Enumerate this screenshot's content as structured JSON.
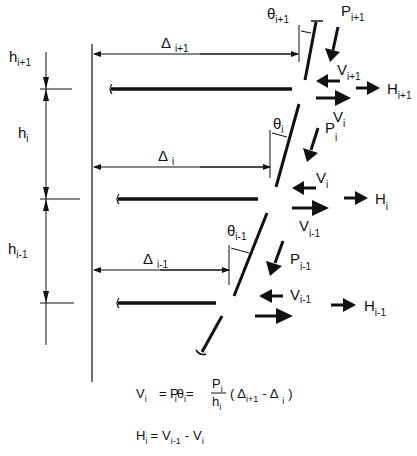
{
  "diagram": {
    "story_heights": [
      {
        "base": "h",
        "sub": "i+1"
      },
      {
        "base": "h",
        "sub": "i"
      },
      {
        "base": "h",
        "sub": "i-1"
      }
    ],
    "displacements": [
      {
        "base": "Δ",
        "sub": "i+1"
      },
      {
        "base": "Δ",
        "sub": "i"
      },
      {
        "base": "Δ",
        "sub": "i-1"
      }
    ],
    "rotations": [
      {
        "base": "θ",
        "sub": "i+1"
      },
      {
        "base": "θ",
        "sub": "i"
      },
      {
        "base": "θ",
        "sub": "i-1"
      }
    ],
    "gravity_loads": [
      {
        "base": "P",
        "sub": "i+1"
      },
      {
        "base": "P",
        "sub": "i"
      },
      {
        "base": "P",
        "sub": "i-1"
      }
    ],
    "shears_left": [
      {
        "base": "V",
        "sub": "i+1"
      },
      {
        "base": "V",
        "sub": "i"
      },
      {
        "base": "V",
        "sub": "i-1"
      }
    ],
    "shears_right": [
      {
        "base": "V",
        "sub": "i"
      },
      {
        "base": "V",
        "sub": "i-1"
      }
    ],
    "lateral_forces": [
      {
        "base": "H",
        "sub": "i+1"
      },
      {
        "base": "H",
        "sub": "i"
      },
      {
        "base": "H",
        "sub": "i-1"
      }
    ],
    "equations": {
      "eq1": {
        "lhs": "V",
        "lhs_sub": "i",
        "eq": "=",
        "p": "P",
        "p_sub": "i",
        "theta": "θ",
        "theta_sub": "i",
        "eq2": "=",
        "num": "P",
        "num_sub": "i",
        "den": "h",
        "den_sub": "i",
        "open": "(",
        "d1": "Δ",
        "d1_sub": "i+1",
        "minus": "-",
        "d2": "Δ",
        "d2_sub": "i",
        "close": ")"
      },
      "eq2": {
        "lhs": "H",
        "lhs_sub": "i",
        "eq": "=",
        "a": "V",
        "a_sub": "i-1",
        "minus": "-",
        "b": "V",
        "b_sub": "i"
      }
    }
  }
}
